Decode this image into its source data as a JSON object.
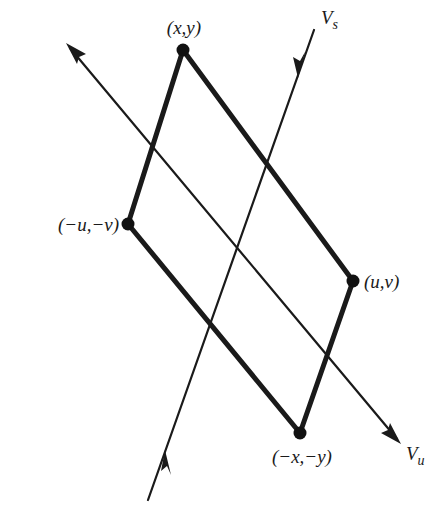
{
  "diagram": {
    "type": "phase-portrait-parallelogram",
    "colors": {
      "ink": "#1a1a1a",
      "background": "#ffffff"
    },
    "axes": [
      {
        "id": "stable",
        "label_main": "V",
        "label_sub": "s",
        "from": [
          148,
          500
        ],
        "to": [
          314,
          30
        ],
        "arrows": "inward"
      },
      {
        "id": "unstable",
        "label_main": "V",
        "label_sub": "u",
        "from": [
          67,
          44
        ],
        "to": [
          400,
          443
        ],
        "arrows": "outward"
      }
    ],
    "vertices": [
      {
        "id": "xy",
        "label": "(x,y)",
        "point": [
          183,
          50
        ]
      },
      {
        "id": "neg-uv",
        "label": "(−u,−v)",
        "point": [
          128,
          224
        ]
      },
      {
        "id": "uv",
        "label": "(u,v)",
        "point": [
          353,
          281
        ]
      },
      {
        "id": "neg-xy",
        "label": "(−x,−y)",
        "point": [
          300,
          433
        ]
      }
    ],
    "edges": [
      [
        "xy",
        "uv"
      ],
      [
        "uv",
        "neg-xy"
      ],
      [
        "neg-xy",
        "neg-uv"
      ],
      [
        "neg-uv",
        "xy"
      ]
    ]
  }
}
